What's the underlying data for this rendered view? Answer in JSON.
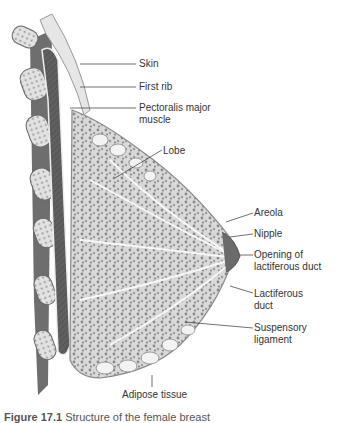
{
  "diagram": {
    "labels": [
      {
        "id": "skin",
        "text": "Skin"
      },
      {
        "id": "first-rib",
        "text": "First rib"
      },
      {
        "id": "pectoralis-1",
        "text": "Pectoralis major"
      },
      {
        "id": "pectoralis-2",
        "text": "muscle"
      },
      {
        "id": "lobe",
        "text": "Lobe"
      },
      {
        "id": "areola",
        "text": "Areola"
      },
      {
        "id": "nipple",
        "text": "Nipple"
      },
      {
        "id": "opening-1",
        "text": "Opening of"
      },
      {
        "id": "opening-2",
        "text": "lactiferous duct"
      },
      {
        "id": "lactiferous-1",
        "text": "Lactiferous"
      },
      {
        "id": "lactiferous-2",
        "text": "duct"
      },
      {
        "id": "suspensory-1",
        "text": "Suspensory"
      },
      {
        "id": "suspensory-2",
        "text": "ligament"
      },
      {
        "id": "adipose",
        "text": "Adipose tissue"
      }
    ],
    "caption": {
      "figure": "Figure 17.1",
      "text": "Structure of the female breast"
    }
  }
}
